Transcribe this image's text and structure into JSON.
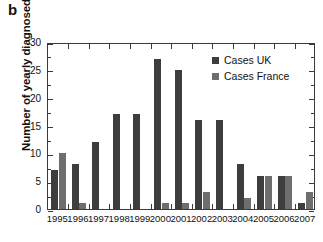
{
  "panel": {
    "label": "b"
  },
  "chart_data": {
    "type": "bar",
    "title": "",
    "subtitle": "",
    "xlabel": "",
    "ylabel": "Number of yearly diagnosed cases",
    "categories": [
      "1995",
      "1996",
      "1997",
      "1998",
      "1999",
      "2000",
      "2001",
      "2002",
      "2003",
      "2004",
      "2005",
      "2006",
      "2007"
    ],
    "series": [
      {
        "name": "Cases UK",
        "color": "#3d3d3d",
        "values": [
          7,
          8,
          12,
          17,
          17,
          27,
          25,
          16,
          16,
          8,
          6,
          6,
          1
        ]
      },
      {
        "name": "Cases France",
        "color": "#6e6e6e",
        "values": [
          10,
          1,
          0,
          0,
          0,
          1,
          1,
          3,
          0,
          2,
          6,
          6,
          3
        ]
      }
    ],
    "ylim": [
      0,
      30
    ],
    "ytick_values": [
      0,
      5,
      10,
      15,
      20,
      25,
      30
    ],
    "ytick_labels": [
      "0",
      "5",
      "10",
      "15",
      "20",
      "25",
      "30"
    ],
    "yminor_interval": 2.5,
    "grid": false,
    "frame": true,
    "tick_direction": "in",
    "legend_position": "upper right",
    "legend": [
      "Cases UK",
      "Cases France"
    ]
  },
  "style": {
    "axis_color": "#3a3a3a",
    "text_color": "#111111",
    "background": "#ffffff"
  }
}
